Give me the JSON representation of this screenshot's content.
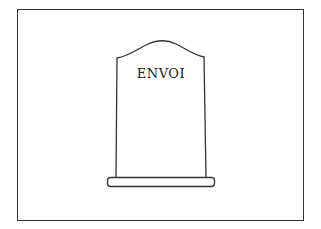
{
  "illustration": {
    "subject": "tombstone",
    "epitaph": "ENVOI",
    "colors": {
      "stroke": "#333333",
      "background": "#ffffff",
      "text": "#222222"
    }
  }
}
